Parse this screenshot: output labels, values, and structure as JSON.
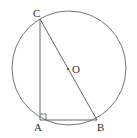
{
  "diagram": {
    "type": "geometry",
    "stroke_color": "#555555",
    "label_color": "#333333",
    "circle": {
      "center_label": "O",
      "cx": 69,
      "cy": 68,
      "r": 57
    },
    "points": {
      "A": {
        "label": "A",
        "x": 40,
        "y": 120
      },
      "B": {
        "label": "B",
        "x": 97,
        "y": 120
      },
      "C": {
        "label": "C",
        "x": 40,
        "y": 19
      },
      "O": {
        "label": "O",
        "x": 68,
        "y": 69
      }
    },
    "segments": [
      "AC",
      "AB",
      "BC"
    ],
    "right_angle_at": "A"
  }
}
